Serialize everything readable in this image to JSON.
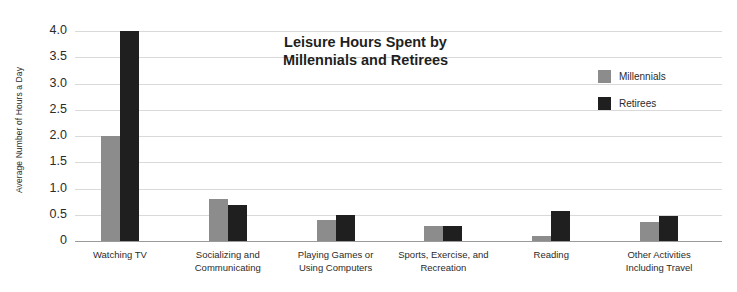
{
  "chart_data": {
    "type": "bar",
    "title": "Leisure Hours Spent by Millennials and Retirees",
    "title_line1": "Leisure Hours Spent by",
    "title_line2": "Millennials and Retirees",
    "xlabel": "",
    "ylabel": "Average Number of Hours a Day",
    "ylim": [
      0,
      4.0
    ],
    "yticks": [
      "0",
      "0.5",
      "1.0",
      "1.5",
      "2.0",
      "2.5",
      "3.0",
      "3.5",
      "4.0"
    ],
    "ytick_values": [
      0,
      0.5,
      1.0,
      1.5,
      2.0,
      2.5,
      3.0,
      3.5,
      4.0
    ],
    "grid": true,
    "legend_position": "top-right",
    "categories": [
      "Watching TV",
      "Socializing and Communicating",
      "Playing Games or Using Computers",
      "Sports, Exercise, and Recreation",
      "Reading",
      "Other Activities Including Travel"
    ],
    "category_lines": [
      [
        "Watching TV"
      ],
      [
        "Socializing and",
        "Communicating"
      ],
      [
        "Playing Games or",
        "Using Computers"
      ],
      [
        "Sports, Exercise, and",
        "Recreation"
      ],
      [
        "Reading"
      ],
      [
        "Other Activities",
        "Including Travel"
      ]
    ],
    "series": [
      {
        "name": "Millennials",
        "color": "#8c8c8c",
        "values": [
          2.0,
          0.8,
          0.4,
          0.28,
          0.1,
          0.37
        ]
      },
      {
        "name": "Retirees",
        "color": "#1f1f1f",
        "values": [
          4.0,
          0.68,
          0.5,
          0.28,
          0.58,
          0.47
        ]
      }
    ]
  },
  "legend": {
    "items": [
      {
        "label": "Millennials",
        "color": "#8c8c8c"
      },
      {
        "label": "Retirees",
        "color": "#1f1f1f"
      }
    ]
  }
}
